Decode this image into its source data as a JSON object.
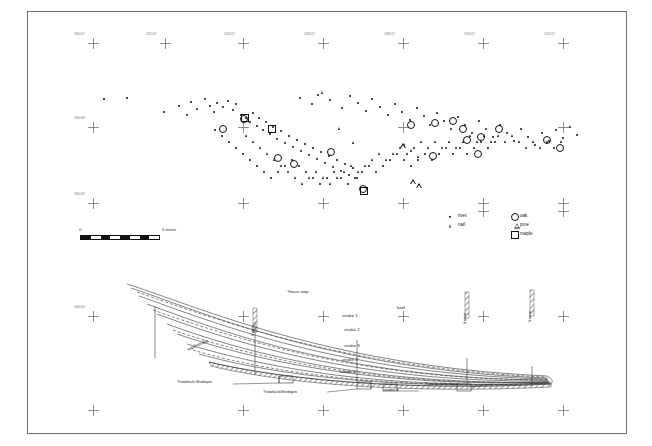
{
  "plate": {
    "title": "Fastening distribution plan and hull reconstruction",
    "background": "#ffffff",
    "border_color": "#6e6e6e"
  },
  "survey_grid": {
    "label_color": "#7a7a7a",
    "marker": "survey-cross",
    "top_row_labels": [
      "180/47",
      "182/47",
      "184/47",
      "186/47",
      "188/47",
      "190/47",
      "192/47"
    ],
    "left_column_labels": [
      "180/46",
      "180/45",
      "180/44",
      "180/43"
    ],
    "mid_row_labels": [
      "184/45",
      "186/45",
      "188/45",
      "190/45"
    ],
    "bottom_row_labels": [
      "184/43",
      "186/43",
      "188/43",
      "190/43"
    ]
  },
  "scale": {
    "zero_label": "0",
    "end_label": "5 metre",
    "segments": 8,
    "units": "metre"
  },
  "legend": {
    "title": "",
    "fastenings": [
      {
        "symbol": "filled-circle",
        "label": "rivet"
      },
      {
        "symbol": "filled-triangle",
        "label": "nail"
      }
    ],
    "timbers": [
      {
        "symbol": "open-circle",
        "label": "oak"
      },
      {
        "symbol": "open-triangle",
        "label": "pine"
      },
      {
        "symbol": "open-square",
        "label": "maple"
      }
    ]
  },
  "hull": {
    "labels": {
      "mast_step": "?mast step",
      "keel": "keel",
      "strake_1": "strake 1",
      "strake_2": "strake 2",
      "strake_3": "strake 3",
      "strake_4": "strake 4",
      "strake_5": "strake 5",
      "strake_6": "strake 6",
      "washstrake": "washstrake",
      "frame_left": "frame",
      "frame_mid": "frame",
      "frame_right": "frame",
      "rowlock_left": "?rowlock /tholepin",
      "rowlock_mid": "?rowlock/tholepin",
      "rowlock_right": "?rowlock/tholepin"
    }
  },
  "chart_data": {
    "type": "scatter",
    "xlabel": "site grid easting",
    "ylabel": "site grid northing",
    "series": [
      {
        "name": "rivet",
        "symbol": "filled-circle",
        "count": 121,
        "points": [
          [
            104,
            99
          ],
          [
            127,
            98
          ],
          [
            164,
            112
          ],
          [
            179,
            106
          ],
          [
            187,
            115
          ],
          [
            191,
            102
          ],
          [
            197,
            109
          ],
          [
            205,
            99
          ],
          [
            210,
            106
          ],
          [
            214,
            112
          ],
          [
            217,
            103
          ],
          [
            223,
            107
          ],
          [
            228,
            101
          ],
          [
            233,
            110
          ],
          [
            236,
            104
          ],
          [
            241,
            115
          ],
          [
            246,
            118
          ],
          [
            250,
            122
          ],
          [
            253,
            113
          ],
          [
            257,
            126
          ],
          [
            259,
            118
          ],
          [
            263,
            130
          ],
          [
            266,
            122
          ],
          [
            270,
            134
          ],
          [
            273,
            127
          ],
          [
            277,
            139
          ],
          [
            281,
            131
          ],
          [
            285,
            143
          ],
          [
            289,
            136
          ],
          [
            293,
            147
          ],
          [
            297,
            140
          ],
          [
            301,
            151
          ],
          [
            305,
            144
          ],
          [
            309,
            155
          ],
          [
            313,
            148
          ],
          [
            317,
            159
          ],
          [
            321,
            152
          ],
          [
            325,
            163
          ],
          [
            329,
            156
          ],
          [
            333,
            167
          ],
          [
            337,
            160
          ],
          [
            341,
            171
          ],
          [
            345,
            164
          ],
          [
            349,
            175
          ],
          [
            353,
            168
          ],
          [
            357,
            178
          ],
          [
            300,
            98
          ],
          [
            312,
            104
          ],
          [
            318,
            95
          ],
          [
            330,
            100
          ],
          [
            342,
            108
          ],
          [
            350,
            96
          ],
          [
            358,
            103
          ],
          [
            366,
            111
          ],
          [
            372,
            99
          ],
          [
            380,
            107
          ],
          [
            388,
            115
          ],
          [
            395,
            104
          ],
          [
            402,
            112
          ],
          [
            410,
            120
          ],
          [
            417,
            108
          ],
          [
            424,
            116
          ],
          [
            430,
            125
          ],
          [
            437,
            113
          ],
          [
            444,
            121
          ],
          [
            451,
            129
          ],
          [
            458,
            117
          ],
          [
            465,
            125
          ],
          [
            472,
            133
          ],
          [
            479,
            121
          ],
          [
            486,
            129
          ],
          [
            493,
            137
          ],
          [
            500,
            125
          ],
          [
            507,
            133
          ],
          [
            514,
            141
          ],
          [
            521,
            129
          ],
          [
            528,
            137
          ],
          [
            535,
            145
          ],
          [
            542,
            133
          ],
          [
            549,
            141
          ],
          [
            556,
            130
          ],
          [
            563,
            138
          ],
          [
            570,
            127
          ],
          [
            577,
            135
          ],
          [
            215,
            130
          ],
          [
            222,
            136
          ],
          [
            229,
            142
          ],
          [
            236,
            148
          ],
          [
            243,
            154
          ],
          [
            250,
            160
          ],
          [
            257,
            166
          ],
          [
            264,
            172
          ],
          [
            271,
            178
          ],
          [
            278,
            172
          ],
          [
            285,
            166
          ],
          [
            292,
            160
          ],
          [
            299,
            166
          ],
          [
            306,
            172
          ],
          [
            313,
            178
          ],
          [
            320,
            184
          ],
          [
            327,
            178
          ],
          [
            334,
            172
          ],
          [
            341,
            178
          ],
          [
            348,
            184
          ],
          [
            355,
            178
          ],
          [
            362,
            172
          ],
          [
            369,
            166
          ],
          [
            376,
            172
          ],
          [
            383,
            166
          ],
          [
            390,
            160
          ],
          [
            397,
            154
          ],
          [
            404,
            160
          ],
          [
            411,
            166
          ],
          [
            418,
            160
          ],
          [
            425,
            154
          ],
          [
            432,
            160
          ],
          [
            439,
            154
          ],
          [
            446,
            148
          ],
          [
            453,
            154
          ],
          [
            460,
            148
          ],
          [
            467,
            154
          ],
          [
            474,
            148
          ],
          [
            481,
            142
          ],
          [
            488,
            148
          ],
          [
            495,
            142
          ]
        ]
      },
      {
        "name": "nail",
        "symbol": "filled-triangle",
        "count": 52,
        "points": [
          [
            323,
            92
          ],
          [
            340,
            128
          ],
          [
            354,
            142
          ],
          [
            247,
            135
          ],
          [
            254,
            141
          ],
          [
            261,
            147
          ],
          [
            268,
            153
          ],
          [
            275,
            159
          ],
          [
            282,
            165
          ],
          [
            289,
            171
          ],
          [
            296,
            177
          ],
          [
            303,
            183
          ],
          [
            310,
            177
          ],
          [
            317,
            171
          ],
          [
            324,
            177
          ],
          [
            331,
            183
          ],
          [
            338,
            177
          ],
          [
            345,
            171
          ],
          [
            352,
            165
          ],
          [
            359,
            171
          ],
          [
            366,
            165
          ],
          [
            373,
            159
          ],
          [
            380,
            153
          ],
          [
            387,
            159
          ],
          [
            394,
            153
          ],
          [
            401,
            147
          ],
          [
            408,
            153
          ],
          [
            415,
            147
          ],
          [
            422,
            141
          ],
          [
            429,
            147
          ],
          [
            436,
            141
          ],
          [
            443,
            147
          ],
          [
            450,
            141
          ],
          [
            457,
            147
          ],
          [
            464,
            141
          ],
          [
            471,
            135
          ],
          [
            478,
            141
          ],
          [
            485,
            135
          ],
          [
            492,
            141
          ],
          [
            499,
            135
          ],
          [
            506,
            141
          ],
          [
            513,
            135
          ],
          [
            520,
            141
          ],
          [
            527,
            147
          ],
          [
            534,
            141
          ],
          [
            541,
            147
          ],
          [
            548,
            141
          ],
          [
            555,
            147
          ],
          [
            562,
            141
          ],
          [
            405,
            144
          ],
          [
            412,
            150
          ],
          [
            419,
            156
          ]
        ]
      },
      {
        "name": "oak",
        "symbol": "open-circle",
        "count": 17,
        "points": [
          [
            222,
            128
          ],
          [
            243,
            118
          ],
          [
            277,
            157
          ],
          [
            293,
            163
          ],
          [
            330,
            151
          ],
          [
            362,
            188
          ],
          [
            410,
            124
          ],
          [
            434,
            122
          ],
          [
            432,
            155
          ],
          [
            452,
            120
          ],
          [
            462,
            128
          ],
          [
            466,
            139
          ],
          [
            477,
            153
          ],
          [
            480,
            136
          ],
          [
            498,
            128
          ],
          [
            546,
            139
          ],
          [
            559,
            147
          ]
        ]
      },
      {
        "name": "pine",
        "symbol": "open-triangle",
        "count": 3,
        "points": [
          [
            404,
            146
          ],
          [
            414,
            182
          ],
          [
            420,
            186
          ]
        ]
      },
      {
        "name": "maple",
        "symbol": "open-square",
        "count": 3,
        "points": [
          [
            244,
            117
          ],
          [
            271,
            128
          ],
          [
            363,
            190
          ]
        ]
      }
    ],
    "legend_position": "bottom-right",
    "grid": false
  }
}
